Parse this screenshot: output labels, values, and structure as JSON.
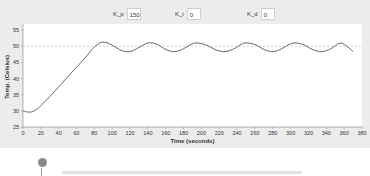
{
  "controls": {
    "kp": {
      "label": "K_p",
      "value": "150"
    },
    "ki": {
      "label": "K_i",
      "value": "0"
    },
    "kd": {
      "label": "K_d",
      "value": "0"
    }
  },
  "chart_data": {
    "type": "line",
    "title": "",
    "xlabel": "Time (seconds)",
    "ylabel": "Temp. (Celsius)",
    "xlim": [
      0,
      380
    ],
    "ylim": [
      25,
      55
    ],
    "xticks": [
      0,
      20,
      40,
      60,
      80,
      100,
      120,
      140,
      160,
      180,
      200,
      220,
      240,
      260,
      280,
      300,
      320,
      340,
      360,
      380
    ],
    "yticks": [
      25,
      30,
      35,
      40,
      45,
      50,
      55
    ],
    "grid": false,
    "legend": null,
    "setpoint": {
      "y": 50,
      "style": "dashed",
      "color": "#b0b0b0"
    },
    "series": [
      {
        "name": "Temperature",
        "color": "#555555",
        "x": [
          0,
          4,
          8,
          12,
          16,
          20,
          30,
          40,
          50,
          60,
          70,
          78,
          84,
          88,
          94,
          100,
          108,
          115,
          122,
          130,
          140,
          150,
          160,
          170,
          180,
          188,
          195,
          205,
          215,
          225,
          235,
          245,
          250,
          260,
          270,
          280,
          290,
          298,
          305,
          315,
          325,
          335,
          345,
          355,
          362,
          370
        ],
        "y": [
          30,
          29.7,
          29.6,
          29.9,
          30.6,
          31.6,
          34.4,
          37.4,
          40.5,
          43.5,
          46.5,
          49.2,
          50.6,
          51.2,
          51.1,
          50.3,
          49.0,
          48.3,
          48.5,
          49.6,
          51.0,
          50.6,
          49.0,
          48.3,
          49.2,
          50.5,
          51.0,
          50.4,
          49.0,
          48.3,
          49.0,
          50.6,
          51.0,
          50.5,
          49.0,
          48.3,
          49.2,
          50.5,
          51.0,
          50.4,
          48.9,
          48.3,
          49.2,
          50.9,
          50.2,
          48.3
        ]
      }
    ]
  },
  "footer": {
    "text": ""
  }
}
